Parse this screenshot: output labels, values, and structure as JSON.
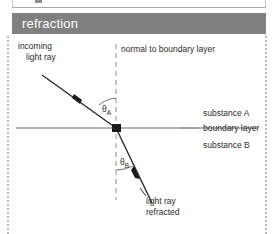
{
  "header": {
    "title": "refraction",
    "bar_color": "#808080",
    "text_color": "#ffffff"
  },
  "diagram": {
    "name": "refraction-diagram",
    "labels": {
      "incoming_ray_line1": "incoming",
      "incoming_ray_line2": "light ray",
      "normal": "normal to boundary layer",
      "substance_a": "substance A",
      "boundary_layer": "boundary layer",
      "substance_b": "substance B",
      "refracted_line1": "light ray",
      "refracted_line2": "refracted",
      "angle_a": "θ",
      "angle_a_sub": "A",
      "angle_b": "θ",
      "angle_b_sub": "B"
    },
    "colors": {
      "ray": "#2b2b2b",
      "boundary": "#9a9a9a",
      "normal_dash": "#a8a8a8",
      "node": "#1a1a1a",
      "arc": "#6f6f6f",
      "rail": "#b9b9b9"
    },
    "geometry": {
      "incident_point": [
        116,
        128
      ],
      "incident_ray_start": [
        42,
        75
      ],
      "refracted_ray_end": [
        152,
        203
      ],
      "normal_x": 116,
      "normal_top_y": 44,
      "normal_bottom_y": 200,
      "boundary_y": 128,
      "boundary_x_start": 16,
      "boundary_x_end": 258
    }
  }
}
